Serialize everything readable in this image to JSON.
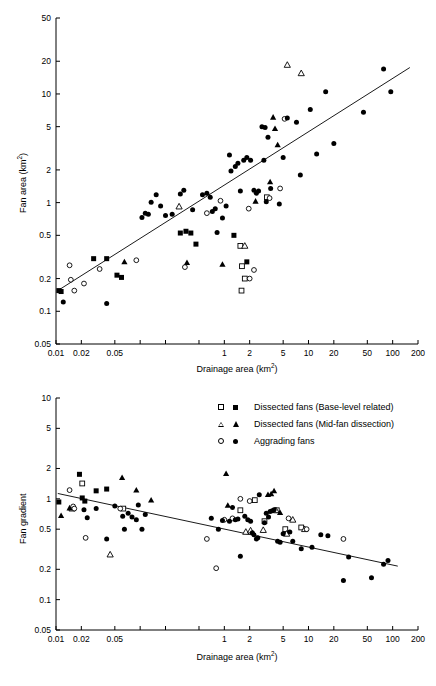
{
  "figure": {
    "width": 436,
    "height": 686,
    "background": "#ffffff",
    "ink": "#000000"
  },
  "legend": {
    "position": "top-center-of-lower-panel",
    "entries": [
      {
        "label": "Dissected fans (Base-level related)",
        "open_marker": "square-open-icon",
        "filled_marker": "square-filled-icon"
      },
      {
        "label": "Dissected fans (Mid-fan dissection)",
        "open_marker": "triangle-open-icon",
        "filled_marker": "triangle-filled-icon"
      },
      {
        "label": "Aggrading fans",
        "open_marker": "circle-open-icon",
        "filled_marker": "circle-filled-icon"
      }
    ]
  },
  "chart_data": [
    {
      "id": "fan-area-vs-drainage-area",
      "type": "scatter",
      "title": "",
      "xlabel": "Drainage area (km2)",
      "xlabel_base": "Drainage area (km",
      "xlabel_sup": "2",
      "xlabel_tail": ")",
      "ylabel": "Fan area (km2)",
      "ylabel_base": "Fan area (km",
      "ylabel_sup": "2",
      "ylabel_tail": ")",
      "xscale": "log",
      "yscale": "log",
      "xlim": [
        0.01,
        200
      ],
      "ylim": [
        0.05,
        50
      ],
      "grid": false,
      "xticks": [
        0.01,
        0.02,
        0.05,
        0.1,
        0.2,
        0.5,
        1,
        2,
        5,
        10,
        20,
        50,
        100,
        200
      ],
      "xticklabels": [
        "0.01",
        "0.02",
        "0.05",
        "",
        "",
        "",
        "1",
        "2",
        "5",
        "10",
        "20",
        "50",
        "100",
        "200"
      ],
      "yticks": [
        0.05,
        0.1,
        0.2,
        0.5,
        1,
        2,
        5,
        10,
        20,
        50
      ],
      "yticklabels": [
        "0.05",
        "0.1",
        "0.2",
        "0.5",
        "1",
        "2",
        "5",
        "10",
        "20",
        "50"
      ],
      "trendline": {
        "x": [
          0.0105,
          160
        ],
        "y": [
          0.155,
          17.5
        ]
      },
      "series": [
        {
          "name": "Dissected fans (Base-level related)",
          "marker": "square-open-icon",
          "points": [
            [
              1.55,
              0.4
            ],
            [
              1.62,
              0.26
            ],
            [
              1.6,
              0.155
            ],
            [
              1.75,
              0.2
            ],
            [
              3.2,
              1.12
            ]
          ]
        },
        {
          "name": "Dissected fans (Base-level related) filled",
          "marker": "square-filled-icon",
          "points": [
            [
              0.0108,
              0.155
            ],
            [
              0.0115,
              0.152
            ],
            [
              0.028,
              0.305
            ],
            [
              0.04,
              0.305
            ],
            [
              0.053,
              0.215
            ],
            [
              0.06,
              0.205
            ],
            [
              0.3,
              0.525
            ],
            [
              0.35,
              0.545
            ],
            [
              0.4,
              0.525
            ],
            [
              0.46,
              0.415
            ],
            [
              1.3,
              0.5
            ],
            [
              1.85,
              0.285
            ]
          ]
        },
        {
          "name": "Dissected fans (Mid-fan dissection)",
          "marker": "triangle-open-icon",
          "points": [
            [
              0.29,
              0.92
            ],
            [
              1.75,
              0.4
            ],
            [
              5.6,
              18.5
            ],
            [
              8.2,
              15.5
            ]
          ]
        },
        {
          "name": "Dissected fans (Mid-fan dissection) filled",
          "marker": "triangle-filled-icon",
          "points": [
            [
              0.065,
              0.285
            ],
            [
              0.36,
              0.28
            ],
            [
              0.95,
              0.27
            ],
            [
              3.5,
              1.55
            ],
            [
              3.8,
              6.1
            ],
            [
              4.3,
              3.4
            ],
            [
              2.35,
              1.03
            ],
            [
              4.0,
              4.8
            ]
          ]
        },
        {
          "name": "Aggrading fans",
          "marker": "circle-open-icon",
          "points": [
            [
              0.0145,
              0.265
            ],
            [
              0.015,
              0.195
            ],
            [
              0.0165,
              0.155
            ],
            [
              0.0215,
              0.18
            ],
            [
              0.033,
              0.245
            ],
            [
              0.09,
              0.295
            ],
            [
              0.34,
              0.255
            ],
            [
              0.62,
              0.8
            ],
            [
              0.9,
              1.04
            ],
            [
              1.95,
              0.88
            ],
            [
              2.25,
              0.24
            ],
            [
              3.45,
              1.1
            ],
            [
              4.6,
              1.35
            ],
            [
              5.2,
              5.9
            ],
            [
              2.0,
              0.2
            ]
          ]
        },
        {
          "name": "Aggrading fans filled",
          "marker": "circle-filled-icon",
          "points": [
            [
              0.0122,
              0.122
            ],
            [
              0.04,
              0.118
            ],
            [
              0.105,
              0.73
            ],
            [
              0.115,
              0.8
            ],
            [
              0.125,
              0.78
            ],
            [
              0.135,
              1.01
            ],
            [
              0.155,
              1.18
            ],
            [
              0.175,
              0.93
            ],
            [
              0.2,
              0.76
            ],
            [
              0.24,
              0.78
            ],
            [
              0.3,
              1.2
            ],
            [
              0.33,
              1.3
            ],
            [
              0.42,
              0.86
            ],
            [
              0.55,
              1.18
            ],
            [
              0.62,
              1.22
            ],
            [
              0.68,
              1.12
            ],
            [
              0.72,
              0.83
            ],
            [
              0.78,
              0.88
            ],
            [
              0.82,
              0.53
            ],
            [
              0.95,
              0.72
            ],
            [
              1.05,
              0.93
            ],
            [
              1.15,
              2.75
            ],
            [
              1.2,
              1.95
            ],
            [
              1.35,
              2.15
            ],
            [
              1.45,
              2.3
            ],
            [
              1.55,
              1.28
            ],
            [
              1.7,
              2.45
            ],
            [
              1.85,
              2.6
            ],
            [
              2.05,
              2.45
            ],
            [
              2.25,
              1.3
            ],
            [
              2.4,
              1.22
            ],
            [
              2.55,
              1.28
            ],
            [
              2.8,
              5.0
            ],
            [
              2.95,
              2.45
            ],
            [
              3.05,
              4.9
            ],
            [
              3.15,
              1.02
            ],
            [
              3.3,
              4.0
            ],
            [
              3.55,
              1.35
            ],
            [
              4.5,
              0.97
            ],
            [
              5.0,
              2.6
            ],
            [
              5.6,
              6.0
            ],
            [
              7.2,
              5.5
            ],
            [
              8.0,
              1.8
            ],
            [
              10.5,
              7.2
            ],
            [
              12.5,
              2.8
            ],
            [
              16.0,
              10.5
            ],
            [
              20.0,
              3.5
            ],
            [
              45.0,
              6.8
            ],
            [
              78.0,
              17.0
            ],
            [
              95.0,
              10.5
            ]
          ]
        }
      ]
    },
    {
      "id": "fan-gradient-vs-drainage-area",
      "type": "scatter",
      "title": "",
      "xlabel": "Drainage area (km2)",
      "xlabel_base": "Drainage area (km",
      "xlabel_sup": "2",
      "xlabel_tail": ")",
      "ylabel": "Fan gradient",
      "xscale": "log",
      "yscale": "log",
      "xlim": [
        0.01,
        200
      ],
      "ylim": [
        0.05,
        10
      ],
      "grid": false,
      "xticks": [
        0.01,
        0.02,
        0.05,
        0.1,
        0.2,
        0.5,
        1,
        2,
        5,
        10,
        20,
        50,
        100,
        200
      ],
      "xticklabels": [
        "0.01",
        "0.02",
        "0.05",
        "",
        "",
        "",
        "1",
        "2",
        "5",
        "10",
        "20",
        "50",
        "100",
        "200"
      ],
      "yticks": [
        0.05,
        0.1,
        0.2,
        0.5,
        1,
        2,
        5,
        10
      ],
      "yticklabels": [
        "0.05",
        "0.1",
        "0.2",
        "0.5",
        "1",
        "2",
        "5",
        "10"
      ],
      "trendline": {
        "x": [
          0.0105,
          115
        ],
        "y": [
          1.13,
          0.215
        ]
      },
      "series": [
        {
          "name": "Dissected fans (Base-level related)",
          "marker": "square-open-icon",
          "points": [
            [
              0.0205,
              1.42
            ],
            [
              0.063,
              0.8
            ],
            [
              1.55,
              0.77
            ],
            [
              2.3,
              0.97
            ],
            [
              3.0,
              0.6
            ],
            [
              4.2,
              0.77
            ],
            [
              5.3,
              0.5
            ],
            [
              8.2,
              0.52
            ]
          ]
        },
        {
          "name": "Dissected fans (Base-level related) filled",
          "marker": "square-filled-icon",
          "points": [
            [
              0.0108,
              0.93
            ],
            [
              0.019,
              1.75
            ],
            [
              0.0205,
              1.02
            ],
            [
              0.022,
              0.95
            ],
            [
              0.03,
              1.2
            ],
            [
              0.04,
              1.25
            ]
          ]
        },
        {
          "name": "Dissected fans (Mid-fan dissection)",
          "marker": "triangle-open-icon",
          "points": [
            [
              0.0155,
              0.8
            ],
            [
              0.044,
              0.28
            ],
            [
              1.8,
              0.47
            ],
            [
              2.05,
              0.485
            ],
            [
              2.9,
              0.49
            ],
            [
              4.1,
              0.77
            ],
            [
              6.5,
              0.62
            ],
            [
              9.0,
              0.5
            ],
            [
              5.5,
              0.45
            ]
          ]
        },
        {
          "name": "Dissected fans (Mid-fan dissection) filled",
          "marker": "triangle-filled-icon",
          "points": [
            [
              0.0115,
              0.68
            ],
            [
              0.0145,
              0.81
            ],
            [
              0.061,
              1.62
            ],
            [
              0.09,
              1.22
            ],
            [
              0.135,
              0.97
            ],
            [
              1.05,
              1.78
            ],
            [
              1.1,
              0.86
            ],
            [
              3.3,
              1.1
            ],
            [
              3.6,
              1.12
            ],
            [
              3.9,
              1.2
            ],
            [
              4.6,
              0.73
            ]
          ]
        },
        {
          "name": "Aggrading fans",
          "marker": "circle-open-icon",
          "points": [
            [
              0.0145,
              1.22
            ],
            [
              0.016,
              0.84
            ],
            [
              0.0165,
              0.8
            ],
            [
              0.0225,
              0.41
            ],
            [
              0.058,
              0.8
            ],
            [
              0.62,
              0.4
            ],
            [
              0.8,
              0.205
            ],
            [
              1.0,
              0.62
            ],
            [
              1.25,
              0.64
            ],
            [
              1.55,
              1.0
            ],
            [
              2.0,
              0.95
            ],
            [
              5.8,
              0.64
            ],
            [
              9.5,
              0.5
            ],
            [
              26.0,
              0.4
            ]
          ]
        },
        {
          "name": "Aggrading fans filled",
          "marker": "circle-filled-icon",
          "points": [
            [
              0.0215,
              0.78
            ],
            [
              0.0235,
              0.65
            ],
            [
              0.03,
              0.8
            ],
            [
              0.04,
              0.4
            ],
            [
              0.05,
              0.85
            ],
            [
              0.062,
              0.67
            ],
            [
              0.065,
              0.5
            ],
            [
              0.072,
              0.72
            ],
            [
              0.08,
              0.66
            ],
            [
              0.09,
              0.62
            ],
            [
              0.095,
              0.87
            ],
            [
              0.105,
              0.5
            ],
            [
              0.115,
              0.7
            ],
            [
              0.7,
              0.64
            ],
            [
              0.85,
              0.5
            ],
            [
              0.95,
              0.61
            ],
            [
              1.15,
              0.6
            ],
            [
              1.25,
              0.82
            ],
            [
              1.35,
              0.62
            ],
            [
              1.45,
              0.63
            ],
            [
              1.55,
              0.27
            ],
            [
              1.75,
              0.67
            ],
            [
              1.9,
              0.62
            ],
            [
              2.05,
              0.6
            ],
            [
              2.15,
              0.46
            ],
            [
              2.25,
              0.44
            ],
            [
              2.4,
              0.4
            ],
            [
              2.5,
              0.41
            ],
            [
              2.6,
              1.1
            ],
            [
              3.0,
              0.58
            ],
            [
              3.15,
              0.72
            ],
            [
              3.35,
              0.66
            ],
            [
              3.5,
              0.75
            ],
            [
              3.7,
              0.76
            ],
            [
              3.9,
              0.78
            ],
            [
              4.3,
              0.38
            ],
            [
              4.6,
              0.37
            ],
            [
              5.0,
              0.45
            ],
            [
              6.0,
              0.47
            ],
            [
              6.5,
              0.38
            ],
            [
              8.2,
              0.32
            ],
            [
              11.0,
              0.33
            ],
            [
              14.0,
              0.44
            ],
            [
              17.0,
              0.43
            ],
            [
              26.0,
              0.155
            ],
            [
              30.0,
              0.265
            ],
            [
              56.0,
              0.165
            ],
            [
              78.0,
              0.225
            ],
            [
              88.0,
              0.245
            ]
          ]
        }
      ]
    }
  ]
}
